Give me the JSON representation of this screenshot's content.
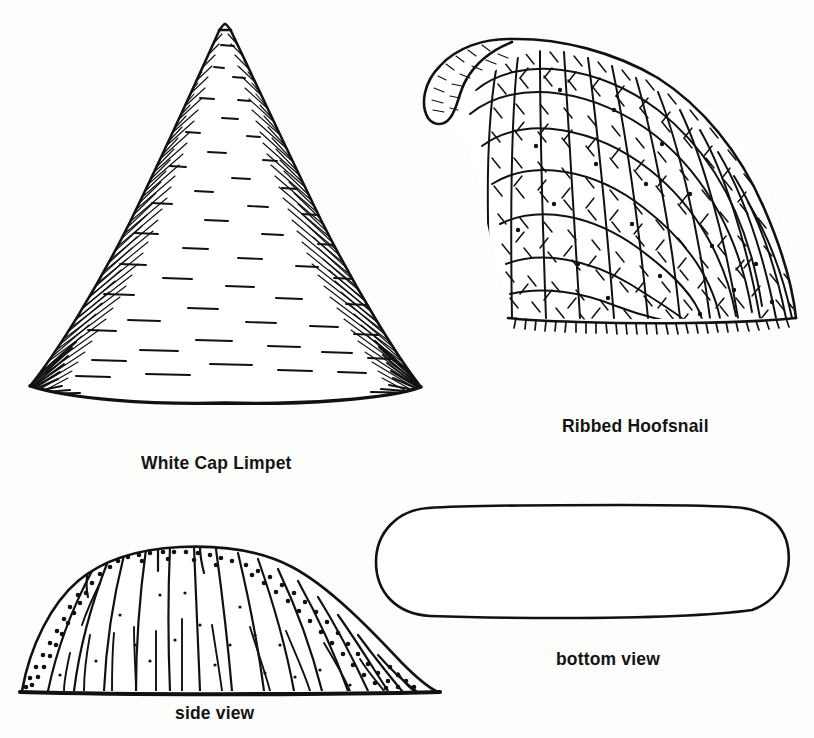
{
  "plate": {
    "width": 814,
    "height": 738,
    "background_color": "#fdfdfb",
    "ink_color": "#111111",
    "style": "black-and-white pen-and-ink natural history line illustration"
  },
  "figures": [
    {
      "id": "white-cap-limpet",
      "caption": "White Cap Limpet",
      "view": "side / apical profile",
      "description": "Tall conical shell with a sharply pointed, slightly blunted apex; flanks covered in fine radial hatching that converges at the basal corners; short horizontal dashes mark growth lines across the face; base is a gently sagging curved line",
      "bounds": {
        "x": 18,
        "y": 20,
        "width": 410,
        "height": 378
      }
    },
    {
      "id": "ribbed-hoofsnail",
      "caption": "Ribbed Hoofsnail",
      "view": "lateral",
      "description": "Cap-shaped shell with a hooked, inrolled beak at the upper left curling downward; surface densely covered in cross-hatched radial ribs and concentric growth ridges; lower margin fringed and serrated",
      "bounds": {
        "x": 416,
        "y": 28,
        "width": 380,
        "height": 296
      }
    },
    {
      "id": "hoofsnail-side-view",
      "caption": "side view",
      "view": "side",
      "description": "Low rounded trapezoidal dome resting on a heavy horizontal baseline; strong radial ribs sweep from the crown down to the base; stippled dots cluster along the upper-left and upper-right slopes",
      "bounds": {
        "x": 18,
        "y": 505,
        "width": 424,
        "height": 190
      }
    },
    {
      "id": "hoofsnail-bottom-view",
      "caption": "bottom view",
      "view": "bottom",
      "description": "Elongated stadium-shaped aperture outline, open and unshaded inside, drawn with a slightly wavering hand-inked contour",
      "bounds": {
        "x": 373,
        "y": 505,
        "width": 423,
        "height": 112
      }
    }
  ],
  "captions": {
    "white_cap_limpet": "White Cap Limpet",
    "ribbed_hoofsnail": "Ribbed Hoofsnail",
    "side_view": "side view",
    "bottom_view": "bottom view"
  }
}
